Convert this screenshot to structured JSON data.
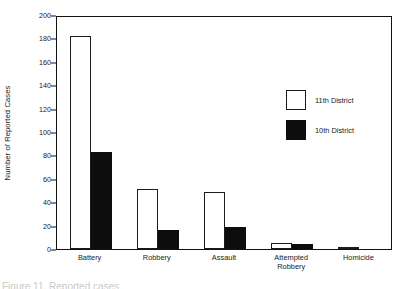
{
  "chart_data": {
    "type": "bar",
    "title": "",
    "xlabel": "",
    "ylabel": "Number of Reported Cases",
    "ylim": [
      0,
      200
    ],
    "ytick_step": 20,
    "yticks": [
      0,
      20,
      40,
      60,
      80,
      100,
      120,
      140,
      160,
      180,
      200
    ],
    "grid": false,
    "legend_position": "upper right (inside axes)",
    "categories": [
      "Battery",
      "Robbery",
      "Assault",
      "Attempted\nRobbery",
      "Homicide"
    ],
    "series": [
      {
        "name": "11th District",
        "color": "#ffffff",
        "edge_color": "#1a1a1a",
        "values": [
          182,
          51,
          49,
          5,
          2
        ]
      },
      {
        "name": "10th District",
        "color": "#0d0d0d",
        "edge_color": "#0d0d0d",
        "values": [
          83,
          16,
          19,
          4,
          0
        ]
      }
    ]
  },
  "axes": {
    "y_title": "Number of Reported Cases",
    "y_tick_labels": [
      "200",
      "180",
      "160",
      "140",
      "120",
      "100",
      "80",
      "60",
      "40",
      "20",
      "0"
    ]
  },
  "legend": {
    "items": [
      {
        "label": "11th District",
        "swatch": "light"
      },
      {
        "label": "10th District",
        "swatch": "dark"
      }
    ]
  },
  "x_axis": {
    "labels": [
      "Battery",
      "Robbery",
      "Assault",
      "Attempted\nRobbery",
      "Homicide"
    ]
  },
  "caption": {
    "text": "Figure 11. Reported cases"
  },
  "colors": {
    "ink": "#1a1a1a",
    "fill_dark": "#0d0d0d",
    "fill_light": "#ffffff",
    "page": "#ffffff"
  }
}
